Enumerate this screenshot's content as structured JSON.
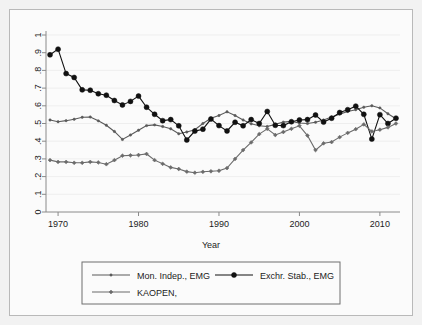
{
  "chart_data": {
    "type": "line",
    "title": "",
    "subtitle": "",
    "xlabel": "Year",
    "ylabel": "",
    "xlim": [
      1968.5,
      2012.5
    ],
    "ylim": [
      0,
      1
    ],
    "grid": true,
    "legend_position": "bottom",
    "xticks": [
      "1970",
      "1980",
      "1990",
      "2000",
      "2010"
    ],
    "xtick_values": [
      1970,
      1980,
      1990,
      2000,
      2010
    ],
    "yticks": [
      "0",
      ".1",
      ".2",
      ".3",
      ".4",
      ".5",
      ".6",
      ".7",
      ".8",
      ".9",
      "1"
    ],
    "ytick_values": [
      0,
      0.1,
      0.2,
      0.3,
      0.4,
      0.5,
      0.6,
      0.7,
      0.8,
      0.9,
      1
    ],
    "x": [
      1969,
      1970,
      1971,
      1972,
      1973,
      1974,
      1975,
      1976,
      1977,
      1978,
      1979,
      1980,
      1981,
      1982,
      1983,
      1984,
      1985,
      1986,
      1987,
      1988,
      1989,
      1990,
      1991,
      1992,
      1993,
      1994,
      1995,
      1996,
      1997,
      1998,
      1999,
      2000,
      2001,
      2002,
      2003,
      2004,
      2005,
      2006,
      2007,
      2008,
      2009,
      2010,
      2011,
      2012
    ],
    "series": [
      {
        "name": "Mon. Indep., EMG",
        "color": "#5a5a5a",
        "marker": "small-circle",
        "values": [
          0.52,
          0.51,
          0.516,
          0.524,
          0.535,
          0.537,
          0.515,
          0.49,
          0.455,
          0.41,
          0.435,
          0.462,
          0.488,
          0.492,
          0.483,
          0.47,
          0.442,
          0.452,
          0.465,
          0.5,
          0.53,
          0.545,
          0.566,
          0.545,
          0.52,
          0.498,
          0.487,
          0.483,
          0.495,
          0.508,
          0.512,
          0.503,
          0.5,
          0.507,
          0.52,
          0.537,
          0.553,
          0.568,
          0.578,
          0.592,
          0.6,
          0.588,
          0.555,
          0.527
        ]
      },
      {
        "name": "Exchr. Stab., EMG",
        "color": "#111111",
        "marker": "large-circle",
        "values": [
          0.888,
          0.92,
          0.782,
          0.76,
          0.69,
          0.688,
          0.668,
          0.66,
          0.63,
          0.605,
          0.625,
          0.655,
          0.592,
          0.552,
          0.516,
          0.522,
          0.487,
          0.407,
          0.457,
          0.468,
          0.525,
          0.488,
          0.458,
          0.507,
          0.487,
          0.522,
          0.5,
          0.568,
          0.49,
          0.488,
          0.51,
          0.52,
          0.522,
          0.548,
          0.508,
          0.53,
          0.562,
          0.578,
          0.598,
          0.552,
          0.412,
          0.55,
          0.5,
          0.53
        ]
      },
      {
        "name": "KAOPEN,",
        "color": "#6b6b6b",
        "marker": "small-diamond",
        "values": [
          0.293,
          0.283,
          0.283,
          0.278,
          0.278,
          0.283,
          0.28,
          0.27,
          0.293,
          0.318,
          0.32,
          0.322,
          0.328,
          0.293,
          0.272,
          0.252,
          0.243,
          0.228,
          0.222,
          0.227,
          0.23,
          0.233,
          0.248,
          0.3,
          0.35,
          0.393,
          0.44,
          0.47,
          0.435,
          0.452,
          0.47,
          0.487,
          0.432,
          0.35,
          0.388,
          0.395,
          0.423,
          0.447,
          0.468,
          0.495,
          0.455,
          0.465,
          0.478,
          0.5
        ]
      }
    ]
  },
  "legend": {
    "entries": [
      {
        "label": "Mon. Indep., EMG"
      },
      {
        "label": "Exchr. Stab., EMG"
      },
      {
        "label": "KAOPEN,"
      }
    ]
  },
  "axes": {
    "x_title": "Year"
  },
  "colors": {
    "background": "#f2f2f2",
    "panel": "#fbfbfb",
    "axis": "#8a8a8a",
    "grid": "#e6e6e6",
    "text": "#1b1b1b",
    "series_1": "#5a5a5a",
    "series_2": "#111111",
    "series_3": "#6b6b6b"
  }
}
